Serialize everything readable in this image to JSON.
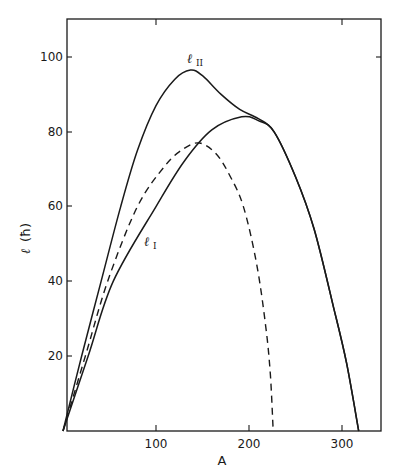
{
  "chart_data": {
    "type": "line",
    "title": "",
    "xlabel": "A",
    "ylabel": "ℓ (ħ)",
    "xlim": [
      0,
      342
    ],
    "ylim": [
      0,
      110
    ],
    "xticks": [
      100,
      200,
      300
    ],
    "yticks": [
      20,
      40,
      60,
      80,
      100
    ],
    "grid": false,
    "legend": "none (curves labeled inline)",
    "series": [
      {
        "name": "ℓ_II",
        "style": "solid",
        "label_main": "ℓ",
        "label_sub": "II",
        "points": [
          [
            0,
            0
          ],
          [
            20,
            20
          ],
          [
            41,
            40
          ],
          [
            62,
            60
          ],
          [
            80,
            75
          ],
          [
            100,
            87
          ],
          [
            120,
            94
          ],
          [
            137,
            96.5
          ],
          [
            150,
            95
          ],
          [
            170,
            90
          ],
          [
            190,
            86
          ],
          [
            210,
            83.5
          ],
          [
            227,
            80
          ],
          [
            250,
            68
          ],
          [
            270,
            54
          ],
          [
            291,
            33
          ],
          [
            305,
            18
          ],
          [
            318,
            0
          ]
        ]
      },
      {
        "name": "ℓ_I",
        "style": "solid",
        "label_main": "ℓ",
        "label_sub": "I",
        "points": [
          [
            0,
            0
          ],
          [
            27,
            20
          ],
          [
            54,
            40
          ],
          [
            100,
            60
          ],
          [
            130,
            72
          ],
          [
            160,
            80.5
          ],
          [
            192,
            84
          ],
          [
            210,
            83
          ],
          [
            227,
            80
          ],
          [
            250,
            68
          ],
          [
            270,
            54
          ],
          [
            291,
            33
          ],
          [
            305,
            18
          ],
          [
            318,
            0
          ]
        ]
      },
      {
        "name": "dashed (unlabeled)",
        "style": "dashed",
        "points": [
          [
            0,
            0
          ],
          [
            24,
            20
          ],
          [
            48,
            40
          ],
          [
            80,
            60
          ],
          [
            110,
            71
          ],
          [
            130,
            75.5
          ],
          [
            147,
            77
          ],
          [
            165,
            74
          ],
          [
            180,
            68
          ],
          [
            194,
            60
          ],
          [
            208,
            45
          ],
          [
            218,
            28
          ],
          [
            223,
            15
          ],
          [
            226,
            0
          ]
        ]
      }
    ]
  },
  "axes": {
    "x_title": "A",
    "y_title_main": "ℓ",
    "y_title_unit": "(ħ)",
    "x_tick_labels": [
      "100",
      "200",
      "300"
    ],
    "y_tick_labels": [
      "20",
      "40",
      "60",
      "80",
      "100"
    ]
  },
  "labels": {
    "l2_main": "ℓ",
    "l2_sub": "II",
    "l1_main": "ℓ",
    "l1_sub": "I"
  },
  "colors": {
    "ink": "#1a1a1a",
    "background": "#ffffff"
  }
}
